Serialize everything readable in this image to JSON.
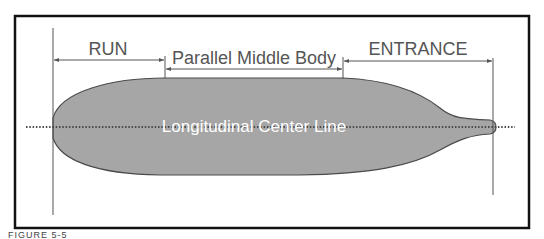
{
  "diagram": {
    "labels": {
      "run": "RUN",
      "parallel_middle_body": "Parallel Middle Body",
      "entrance": "ENTRANCE",
      "center_line": "Longitudinal Center Line"
    },
    "caption": "FIGURE 5-5",
    "colors": {
      "hull_fill": "#a6a6a6",
      "hull_outline": "#4a4a4a",
      "frame": "#111111",
      "text": "#555555",
      "center_line_text": "#ffffff"
    }
  }
}
